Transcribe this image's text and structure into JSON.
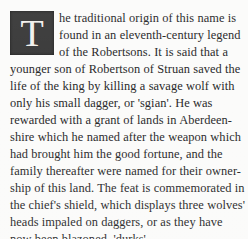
{
  "page": {
    "kind": "printed-book-passage",
    "background_color": "#fbfbfa",
    "text_color": "#29292a"
  },
  "dropcap": {
    "letter": "T",
    "background_color": "#3b3b3b",
    "letter_color": "#f2f1ee"
  },
  "passage": {
    "full_text": "The traditional origin of this name is found in an eleventh-century legend of the Robertsons. It is said that a younger son of Robertson of Struan saved the life of the king by killing a savage wolf with only his small dagger, or 'sgian'. He was rewarded with a grant of lands in Aberdeenshire which he named after the weapon which had brought him the good fortune, and the family thereafter were named for their ownership of this land. The feat is commemorated in the chief's shield, which displays three wolves' heads impaled on daggers, or as they have now been blazoned, 'durks'.",
    "lines": [
      "he traditional origin of this name is",
      "found in an eleventh-century legend",
      "of the Robertsons. It is said that a",
      "younger son of Robertson of Struan saved the",
      "life of the king by killing a savage wolf with",
      "only his small dagger, or 'sgian'. He was",
      "rewarded with a grant of lands in Aberdeen-",
      "shire which he named after the weapon which",
      "had brought him the good fortune, and the",
      "family thereafter were named for their owner-",
      "ship of this land. The feat is commemorated in",
      "the chief's shield, which displays three wolves'",
      "heads impaled on daggers, or as they have",
      "now been blazoned, 'durks'."
    ]
  }
}
